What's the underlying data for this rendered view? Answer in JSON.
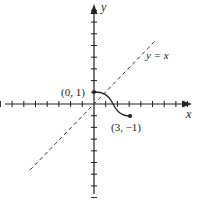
{
  "diagram": {
    "title": "",
    "axes": {
      "x_label": "x",
      "y_label": "y",
      "x_ticks_negative": 8,
      "x_ticks_positive": 8,
      "y_ticks_positive": 8,
      "y_ticks_negative": 8
    },
    "line": {
      "label": "y = x",
      "style": "dashed"
    },
    "curve": {
      "start_point_label": "(0, 1)",
      "end_point_label": "(3, −1)",
      "start": [
        0,
        1
      ],
      "end": [
        3,
        -1
      ]
    },
    "colors": {
      "ink": "#222222",
      "background": "#ffffff"
    }
  }
}
